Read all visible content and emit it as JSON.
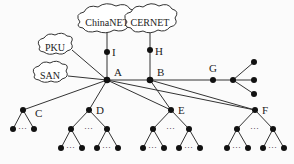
{
  "diagram": {
    "clouds": [
      {
        "id": "chinanet",
        "label": "ChinaNET"
      },
      {
        "id": "cernet",
        "label": "CERNET"
      },
      {
        "id": "pku",
        "label": "PKU"
      },
      {
        "id": "san",
        "label": "SAN"
      }
    ],
    "nodes": {
      "A": "A",
      "B": "B",
      "C": "C",
      "D": "D",
      "E": "E",
      "F": "F",
      "G": "G",
      "H": "H",
      "I": "I"
    },
    "ellipsis": "···"
  }
}
